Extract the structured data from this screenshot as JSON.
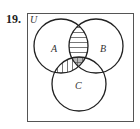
{
  "problem": {
    "number": "19.",
    "universe_label": "U",
    "sets": [
      {
        "name": "A",
        "cx": 61,
        "cy": 46,
        "r": 27
      },
      {
        "name": "B",
        "cx": 96,
        "cy": 46,
        "r": 27
      },
      {
        "name": "C",
        "cx": 79,
        "cy": 84,
        "r": 27
      }
    ],
    "shaded_regions": [
      {
        "region": "A∩B (outside C)",
        "pattern": "horizontal-lines"
      },
      {
        "region": "A∩C (outside B)",
        "pattern": "vertical-lines"
      },
      {
        "region": "A∩B∩C",
        "pattern": "cross-hatch-gray"
      }
    ],
    "colors": {
      "stroke": "#222222",
      "hatch": "#555555",
      "center_fill": "#bbbbbb",
      "box": "#555555"
    }
  }
}
